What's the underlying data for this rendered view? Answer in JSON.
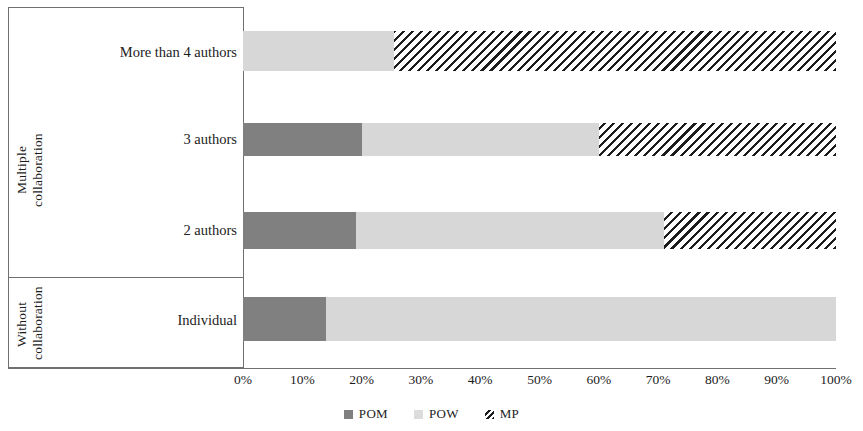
{
  "chart_data": {
    "type": "bar",
    "orientation": "horizontal",
    "stacked": true,
    "stack_mode": "percent",
    "title": "",
    "xlabel": "",
    "ylabel": "",
    "xlim": [
      0,
      100
    ],
    "xticks": [
      "0%",
      "10%",
      "20%",
      "30%",
      "40%",
      "50%",
      "60%",
      "70%",
      "80%",
      "90%",
      "100%"
    ],
    "xtick_values": [
      0,
      10,
      20,
      30,
      40,
      50,
      60,
      70,
      80,
      90,
      100
    ],
    "grid": false,
    "legend_position": "bottom",
    "categories": [
      "More than 4 authors",
      "3 authors",
      "2 authors",
      "Individual"
    ],
    "groups": [
      {
        "label": "Multiple\ncollaboration",
        "categories": [
          "More than 4 authors",
          "3 authors",
          "2 authors"
        ]
      },
      {
        "label": "Without\ncollaboration",
        "categories": [
          "Individual"
        ]
      }
    ],
    "series": [
      {
        "name": "POM",
        "color": "#808080",
        "pattern": "solid",
        "values": [
          0,
          20,
          19,
          14
        ]
      },
      {
        "name": "POW",
        "color": "#d7d7d7",
        "pattern": "solid",
        "values": [
          25.5,
          40,
          52,
          86
        ]
      },
      {
        "name": "MP",
        "color": "#ffffff",
        "pattern": "diagonal-hatch",
        "values": [
          74.5,
          40,
          29,
          0
        ]
      }
    ]
  },
  "axis": {
    "ticks": [
      {
        "label": "0%",
        "value": 0
      },
      {
        "label": "10%",
        "value": 10
      },
      {
        "label": "20%",
        "value": 20
      },
      {
        "label": "30%",
        "value": 30
      },
      {
        "label": "40%",
        "value": 40
      },
      {
        "label": "50%",
        "value": 50
      },
      {
        "label": "60%",
        "value": 60
      },
      {
        "label": "70%",
        "value": 70
      },
      {
        "label": "80%",
        "value": 80
      },
      {
        "label": "90%",
        "value": 90
      },
      {
        "label": "100%",
        "value": 100
      }
    ]
  },
  "groups": {
    "multiple": {
      "line1": "Multiple",
      "line2": "collaboration"
    },
    "without": {
      "line1": "Without",
      "line2": "collaboration"
    }
  },
  "categories": [
    {
      "label": "More than 4 authors"
    },
    {
      "label": "3 authors"
    },
    {
      "label": "2 authors"
    },
    {
      "label": "Individual"
    }
  ],
  "legend": {
    "items": [
      {
        "label": "POM",
        "marker": "solid-dark-gray-square"
      },
      {
        "label": "POW",
        "marker": "solid-light-gray-square"
      },
      {
        "label": "MP",
        "marker": "diagonal-hatch-square"
      }
    ]
  },
  "colors": {
    "pom": "#808080",
    "pow": "#d7d7d7",
    "mp_hatch": "#1c1c1c",
    "axis": "#6f6f6f",
    "text": "#1c1c1c"
  }
}
